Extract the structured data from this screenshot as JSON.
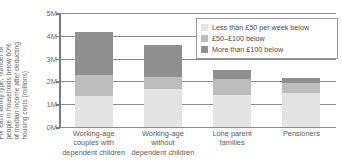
{
  "chart_data": {
    "type": "bar",
    "stacked": true,
    "title": "",
    "xlabel": "",
    "ylabel": "For each family type, number of people in households below 60% of median income after deducting housing costs (millions)",
    "ylim": [
      0,
      5
    ],
    "ytick_values": [
      0,
      1,
      2,
      3,
      4,
      5
    ],
    "ytick_labels": [
      "0M",
      "1M",
      "2M",
      "3M",
      "4M",
      "5M"
    ],
    "grid": true,
    "legend_position": "upper-right",
    "categories": [
      "Working-age couples with dependent children",
      "Working-age without dependent children",
      "Lone parent families",
      "Pensioners"
    ],
    "series": [
      {
        "name": "Less than £50 per week below",
        "color": "#e4e4e4",
        "values": [
          1.35,
          1.65,
          1.4,
          1.5
        ]
      },
      {
        "name": "£50–£100 below",
        "color": "#bdbdbd",
        "values": [
          0.95,
          0.55,
          0.7,
          0.45
        ]
      },
      {
        "name": "More than £100 below",
        "color": "#8f8f8f",
        "values": [
          1.85,
          1.4,
          0.4,
          0.2
        ]
      }
    ],
    "totals": [
      4.15,
      3.6,
      2.5,
      2.15
    ]
  },
  "title_strip": {
    "text": ""
  },
  "axis": {
    "y_caption_lines": [
      "For each family type, number of",
      "people in households below 60%",
      "of median income after deducting",
      "housing costs (millions)"
    ]
  },
  "x_labels": [
    {
      "lines": [
        "Working-age",
        "couples with",
        "dependent children"
      ]
    },
    {
      "lines": [
        "Working-age",
        "without",
        "dependent children"
      ]
    },
    {
      "lines": [
        "Lone parent",
        "families"
      ]
    },
    {
      "lines": [
        "Pensioners"
      ]
    }
  ],
  "legend": {
    "items": [
      {
        "label": "Less than £50 per week below",
        "color": "#e4e4e4"
      },
      {
        "label": "£50–£100 below",
        "color": "#bdbdbd"
      },
      {
        "label": "More than £100 below",
        "color": "#8f8f8f"
      }
    ]
  },
  "colors": {
    "light": "#e4e4e4",
    "mid": "#bdbdbd",
    "dark": "#8f8f8f",
    "grid": "#8c8c8c",
    "axis": "#7a7a7a",
    "text": "#5a5a5a"
  }
}
